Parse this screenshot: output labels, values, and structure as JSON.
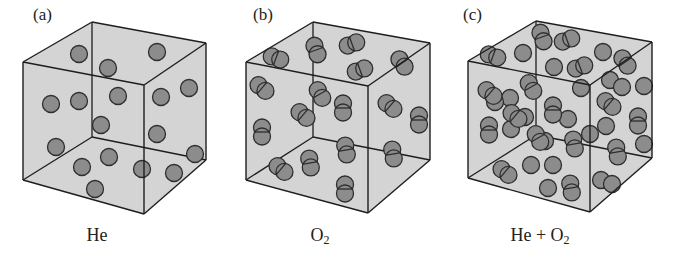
{
  "figure": {
    "style": {
      "box_fill": "#d4d4d4",
      "edge_color": "#1e1e1e",
      "atom_fill": "#8c8c8c",
      "atom_stroke": "#2e2e2e",
      "atom_radius": 8.5
    },
    "panels": [
      {
        "id": "a",
        "label": "(a)",
        "label_pos": [
          33,
          6
        ],
        "caption_parts": [
          "He"
        ],
        "caption_x": 97,
        "caption_y": 226,
        "cube": {
          "btl": [
            92,
            22
          ],
          "btr": [
            206,
            43
          ],
          "bbl": [
            92,
            137
          ],
          "bbr": [
            206,
            160
          ],
          "ftl": [
            23,
            62
          ],
          "ftr": [
            144,
            85
          ],
          "fbl": [
            23,
            180
          ],
          "fbr": [
            144,
            214
          ]
        },
        "atoms": [
          [
            79,
            54
          ],
          [
            108,
            68
          ],
          [
            157,
            52
          ],
          [
            51,
            104
          ],
          [
            79,
            101
          ],
          [
            118,
            96
          ],
          [
            101,
            125
          ],
          [
            56,
            147
          ],
          [
            109,
            157
          ],
          [
            82,
            167
          ],
          [
            142,
            169
          ],
          [
            174,
            173
          ],
          [
            95,
            189
          ],
          [
            189,
            88
          ],
          [
            161,
            97
          ],
          [
            157,
            134
          ],
          [
            195,
            154
          ]
        ],
        "molecules": []
      },
      {
        "id": "b",
        "label": "(b)",
        "label_pos": [
          253,
          6
        ],
        "caption_parts": [
          "O",
          "2"
        ],
        "caption_x": 320,
        "caption_y": 226,
        "cube": {
          "btl": [
            313,
            22
          ],
          "btr": [
            430,
            43
          ],
          "bbl": [
            313,
            137
          ],
          "bbr": [
            430,
            160
          ],
          "ftl": [
            246,
            62
          ],
          "ftr": [
            368,
            86
          ],
          "fbl": [
            246,
            180
          ],
          "fbr": [
            368,
            213
          ]
        },
        "atoms": [],
        "molecules": [
          [
            276,
            58,
            20
          ],
          [
            316,
            50,
            70
          ],
          [
            352,
            44,
            -20
          ],
          [
            360,
            70,
            -20
          ],
          [
            402,
            63,
            55
          ],
          [
            262,
            88,
            40
          ],
          [
            320,
            94,
            60
          ],
          [
            343,
            108,
            90
          ],
          [
            390,
            106,
            40
          ],
          [
            419,
            120,
            90
          ],
          [
            303,
            115,
            40
          ],
          [
            262,
            132,
            90
          ],
          [
            346,
            150,
            80
          ],
          [
            393,
            154,
            80
          ],
          [
            281,
            169,
            40
          ],
          [
            310,
            163,
            80
          ],
          [
            345,
            189,
            90
          ]
        ]
      },
      {
        "id": "c",
        "label": "(c)",
        "label_pos": [
          463,
          6
        ],
        "caption_parts": [
          "He + O",
          "2"
        ],
        "caption_x": 540,
        "caption_y": 226,
        "cube": {
          "btl": [
            536,
            21
          ],
          "btr": [
            652,
            42
          ],
          "bbl": [
            536,
            135
          ],
          "bbr": [
            652,
            158
          ],
          "ftl": [
            468,
            61
          ],
          "ftr": [
            590,
            85
          ],
          "fbl": [
            468,
            178
          ],
          "fbr": [
            590,
            212
          ]
        },
        "atoms": [
          [
            523,
            53
          ],
          [
            603,
            52
          ],
          [
            554,
            67
          ],
          [
            650,
            0
          ],
          [
            644,
            86
          ],
          [
            510,
            98
          ],
          [
            495,
            102
          ],
          [
            581,
            88
          ],
          [
            610,
            80
          ],
          [
            622,
            87
          ],
          [
            568,
            119
          ],
          [
            511,
            129
          ],
          [
            545,
            141
          ],
          [
            644,
            144
          ],
          [
            525,
            117
          ],
          [
            606,
            126
          ],
          [
            590,
            134
          ],
          [
            531,
            165
          ],
          [
            553,
            165
          ],
          [
            601,
            180
          ],
          [
            548,
            188
          ],
          [
            612,
            184
          ]
        ],
        "molecules": [
          [
            493,
            56,
            20
          ],
          [
            542,
            37,
            70
          ],
          [
            567,
            40,
            -20
          ],
          [
            580,
            67,
            -20
          ],
          [
            625,
            62,
            55
          ],
          [
            490,
            93,
            40
          ],
          [
            531,
            87,
            60
          ],
          [
            553,
            110,
            90
          ],
          [
            609,
            104,
            40
          ],
          [
            638,
            121,
            90
          ],
          [
            515,
            116,
            40
          ],
          [
            489,
            130,
            90
          ],
          [
            538,
            138,
            60
          ],
          [
            574,
            144,
            80
          ],
          [
            617,
            152,
            80
          ],
          [
            505,
            172,
            40
          ],
          [
            571,
            188,
            80
          ]
        ]
      }
    ]
  }
}
